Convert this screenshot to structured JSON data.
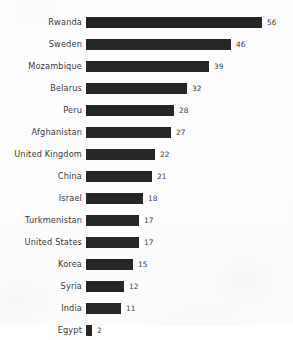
{
  "chart_data": {
    "type": "bar",
    "orientation": "horizontal",
    "title": "",
    "subtitle": "",
    "xlabel": "",
    "ylabel": "",
    "grid": false,
    "legend": false,
    "legend_position": "none",
    "xlim": [
      0,
      56
    ],
    "axis_visible": false,
    "tick_labels_x": [],
    "categories": [
      "Rwanda",
      "Sweden",
      "Mozambique",
      "Belarus",
      "Peru",
      "Afghanistan",
      "United Kingdom",
      "China",
      "Israel",
      "Turkmenistan",
      "United States",
      "Korea",
      "Syria",
      "India",
      "Egypt"
    ],
    "values": [
      56,
      46,
      39,
      32,
      28,
      27,
      22,
      21,
      18,
      17,
      17,
      15,
      12,
      11,
      2
    ],
    "data_labels": [
      "56",
      "46",
      "39",
      "32",
      "28",
      "27",
      "22",
      "21",
      "18",
      "17",
      "17",
      "15",
      "12",
      "11",
      "2"
    ],
    "bar_color": "#262626",
    "background_color": "#fdfdfd",
    "label_color": "#3a3a3a",
    "value_label_color": "#3d3d3d"
  }
}
